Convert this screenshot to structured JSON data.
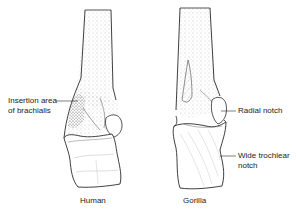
{
  "figure": {
    "specimens": [
      {
        "name": "Human",
        "caption": "Human"
      },
      {
        "name": "Gorilla",
        "caption": "Gorilla"
      }
    ],
    "annotations": {
      "insertion_line1": "Insertion area",
      "insertion_line2": "of brachialis",
      "radial_notch": "Radial notch",
      "trochlear_line1": "Wide trochlear",
      "trochlear_line2": "notch"
    },
    "colors": {
      "outline": "#2a2a2a",
      "stipple": "#8a8a8a",
      "background": "#ffffff"
    }
  }
}
